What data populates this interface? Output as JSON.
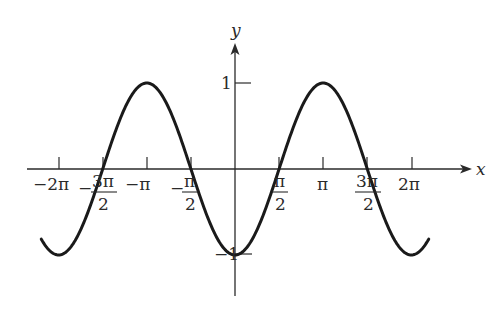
{
  "chart_data": {
    "type": "line",
    "title": "",
    "function": "y = -cos(x)",
    "xlabel": "x",
    "ylabel": "y",
    "xlim": [
      -6.9,
      6.9
    ],
    "ylim": [
      -1,
      1
    ],
    "grid": false,
    "legend": null,
    "series": [
      {
        "name": "y = -cos x",
        "color": "#1a1a1a",
        "x_range": [
          -6.9,
          6.9
        ]
      }
    ],
    "x_ticks": [
      {
        "value": -6.2832,
        "label": "-2π"
      },
      {
        "value": -4.7124,
        "label": "-3π/2"
      },
      {
        "value": -3.1416,
        "label": "-π"
      },
      {
        "value": -1.5708,
        "label": "-π/2"
      },
      {
        "value": 1.5708,
        "label": "π/2"
      },
      {
        "value": 3.1416,
        "label": "π"
      },
      {
        "value": 4.7124,
        "label": "3π/2"
      },
      {
        "value": 6.2832,
        "label": "2π"
      }
    ],
    "y_ticks": [
      {
        "value": 1,
        "label": "1"
      },
      {
        "value": -1,
        "label": "-1"
      }
    ],
    "key_points": [
      {
        "x": -6.2832,
        "y": -1
      },
      {
        "x": -4.7124,
        "y": 0
      },
      {
        "x": -3.1416,
        "y": 1
      },
      {
        "x": -1.5708,
        "y": 0
      },
      {
        "x": 0,
        "y": -1
      },
      {
        "x": 1.5708,
        "y": 0
      },
      {
        "x": 3.1416,
        "y": 1
      },
      {
        "x": 4.7124,
        "y": 0
      },
      {
        "x": 6.2832,
        "y": -1
      }
    ]
  },
  "labels": {
    "x_axis": "x",
    "y_axis": "y",
    "y_one": "1",
    "y_neg_one": "−1",
    "neg_two_pi": "−2π",
    "neg_pi": "−π",
    "pi": "π",
    "two_pi": "2π",
    "minus": "−",
    "three_pi": "3π",
    "pi_num": "π",
    "two": "2"
  },
  "colors": {
    "axis": "#2a2a2a",
    "curve": "#1a1a1a"
  }
}
